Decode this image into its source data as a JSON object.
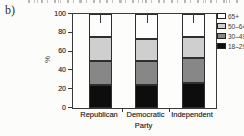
{
  "figure": {
    "panel_label": "b)"
  },
  "chart_data": {
    "type": "bar",
    "stacked": true,
    "title": "",
    "categories": [
      "Republican",
      "Democratic",
      "Independent"
    ],
    "series": [
      {
        "name": "18–29",
        "color": "#0d0d0d",
        "values": [
          24,
          25,
          27
        ]
      },
      {
        "name": "30–49",
        "color": "#878787",
        "values": [
          26,
          25,
          26
        ]
      },
      {
        "name": "50–64",
        "color": "#cfcfcf",
        "values": [
          26,
          23,
          23
        ]
      },
      {
        "name": "65+",
        "color": "#fdfdfd",
        "values": [
          24,
          27,
          24
        ]
      }
    ],
    "xlabel": "Party",
    "ylabel": "%",
    "ylim": [
      0,
      100
    ],
    "yticks": [
      0,
      20,
      40,
      60,
      80,
      100
    ],
    "grid": false,
    "legend_position": "top-right",
    "legend_order": [
      "65+",
      "50–64",
      "30–49",
      "18–29"
    ]
  }
}
